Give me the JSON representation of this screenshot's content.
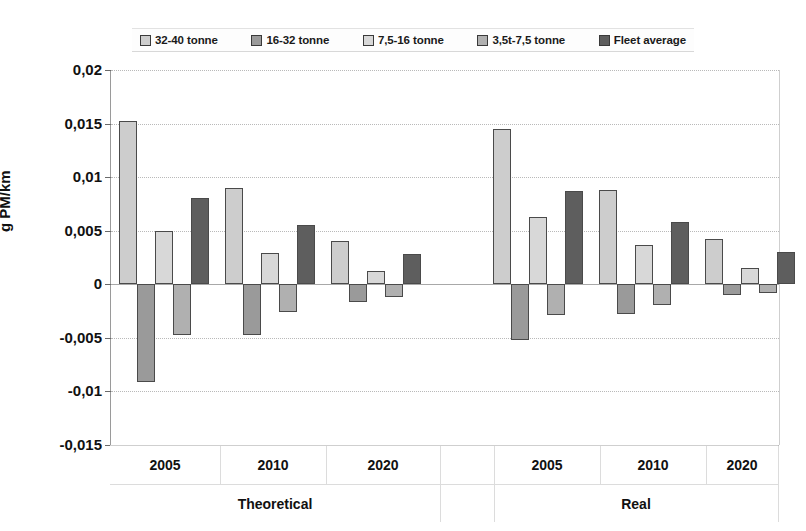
{
  "chart_data": {
    "type": "bar",
    "title": "",
    "xlabel": "",
    "ylabel": "g PM/km",
    "ylim": [
      -0.015,
      0.02
    ],
    "ytick_labels": [
      "0,02",
      "0,015",
      "0,01",
      "0,005",
      "0",
      "-0,005",
      "-0,01",
      "-0,015"
    ],
    "ytick_values": [
      0.02,
      0.015,
      0.01,
      0.005,
      0,
      -0.005,
      -0.01,
      -0.015
    ],
    "grid": true,
    "legend_position": "top",
    "group_labels": [
      "Theoretical",
      "Real"
    ],
    "categories": [
      "2005",
      "2010",
      "2020",
      "2005",
      "2010",
      "2020"
    ],
    "category_groups": [
      {
        "group": "Theoretical",
        "categories": [
          "2005",
          "2010",
          "2020"
        ]
      },
      {
        "group": "Real",
        "categories": [
          "2005",
          "2010",
          "2020"
        ]
      }
    ],
    "series": [
      {
        "name": "32-40 tonne",
        "color": "#cdcdcd",
        "values": [
          0.0152,
          0.009,
          0.004,
          0.0145,
          0.0088,
          0.0042
        ]
      },
      {
        "name": "16-32 tonne",
        "color": "#9a9a9a",
        "values": [
          -0.0091,
          -0.0047,
          -0.0017,
          -0.0052,
          -0.0028,
          -0.001
        ]
      },
      {
        "name": "7,5-16 tonne",
        "color": "#d8d8d8",
        "values": [
          0.005,
          0.0029,
          0.0012,
          0.0063,
          0.0037,
          0.0015
        ]
      },
      {
        "name": "3,5t-7,5 tonne",
        "color": "#b0b0b0",
        "values": [
          -0.0047,
          -0.0026,
          -0.0012,
          -0.0029,
          -0.0019,
          -0.0008
        ]
      },
      {
        "name": "Fleet average",
        "color": "#5e5e5e",
        "values": [
          0.0081,
          0.0055,
          0.0028,
          0.0087,
          0.0058,
          0.003
        ]
      }
    ]
  },
  "legend": {
    "items": [
      {
        "label": "32-40 tonne",
        "color": "#cdcdcd"
      },
      {
        "label": "16-32 tonne",
        "color": "#9a9a9a"
      },
      {
        "label": "7,5-16 tonne",
        "color": "#d8d8d8"
      },
      {
        "label": "3,5t-7,5 tonne",
        "color": "#b0b0b0"
      },
      {
        "label": "Fleet average",
        "color": "#5e5e5e"
      }
    ]
  },
  "axis": {
    "y_title": "g PM/km"
  }
}
